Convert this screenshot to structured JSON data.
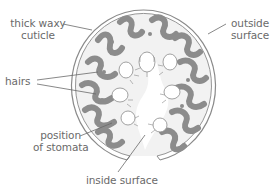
{
  "diagram": {
    "colors": {
      "outline": "#8a8a8a",
      "tissue": "#8c8c8c",
      "fill": "#f2f2f2",
      "leader": "#6a6a6a",
      "text": "#6a6a6a"
    },
    "labels": {
      "thick_waxy_cuticle_line1": "thick waxy",
      "thick_waxy_cuticle_line2": "cuticle",
      "outside_surface_line1": "outside",
      "outside_surface_line2": "surface",
      "hairs": "hairs",
      "position_of_stomata_line1": "position",
      "position_of_stomata_line2": "of stomata",
      "inside_surface": "inside surface"
    }
  }
}
